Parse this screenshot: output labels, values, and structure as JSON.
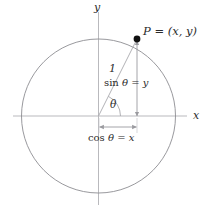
{
  "figure": {
    "background_color": "#ffffff",
    "width": 210,
    "height": 210
  },
  "colors": {
    "axis": "#b9b9bd",
    "circle": "#8d8d92",
    "radius_line": "#a9a9ae",
    "arrow": "#9a9a9f",
    "point_fill": "#111111",
    "text": "#2b2b2b"
  },
  "geometry": {
    "center_x": 98.5,
    "center_y": 116,
    "radius": 77,
    "point_x": 137,
    "point_y": 39,
    "angle_degrees": 63.5,
    "x_axis_start": 13,
    "x_axis_end": 187,
    "y_axis_start": 12,
    "y_axis_end": 205,
    "arc_radius": 22,
    "sin_arrow_x": 137,
    "cos_arrow_y": 127
  },
  "labels": {
    "y_axis": "y",
    "x_axis": "x",
    "point": "P = (x, y)",
    "point_name": "P",
    "point_equals": "=",
    "point_coords": "(x, y)",
    "radius": "1",
    "angle": "θ",
    "sine_prefix": "sin",
    "sine_rest": " θ = y",
    "cosine_prefix": "cos",
    "cosine_rest": " θ = x"
  },
  "math": {
    "sine_identity": "sin θ = y",
    "cosine_identity": "cos θ = x",
    "radius_length": "1"
  }
}
